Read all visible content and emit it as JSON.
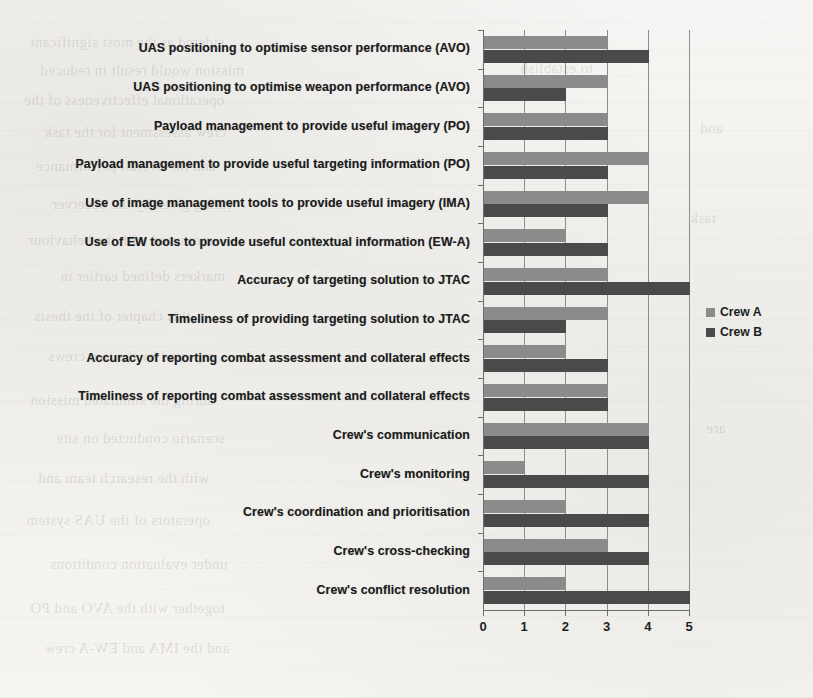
{
  "chart_data": {
    "type": "bar",
    "orientation": "horizontal",
    "title": "",
    "xlabel": "",
    "ylabel": "",
    "xlim": [
      0,
      5
    ],
    "xticks": [
      "0",
      "1",
      "2",
      "3",
      "4",
      "5"
    ],
    "grid": true,
    "legend_position": "right",
    "categories": [
      "UAS positioning to optimise sensor performance (AVO)",
      "UAS positioning to optimise weapon performance (AVO)",
      "Payload management to provide useful imagery (PO)",
      "Payload management to provide useful targeting information (PO)",
      "Use of image management tools to provide useful imagery (IMA)",
      "Use of EW tools to provide useful contextual information (EW-A)",
      "Accuracy of targeting solution to JTAC",
      "Timeliness of providing targeting solution to JTAC",
      "Accuracy of reporting combat assessment and collateral effects",
      "Timeliness of reporting combat assessment and collateral effects",
      "Crew's communication",
      "Crew's monitoring",
      "Crew's coordination and prioritisation",
      "Crew's cross-checking",
      "Crew's conflict resolution"
    ],
    "series": [
      {
        "name": "Crew A",
        "color": "#8b8b8b",
        "values": [
          3,
          3,
          3,
          4,
          4,
          2,
          3,
          3,
          2,
          3,
          4,
          1,
          2,
          3,
          2
        ]
      },
      {
        "name": "Crew B",
        "color": "#4a4a4a",
        "values": [
          4,
          2,
          3,
          3,
          3,
          3,
          5,
          2,
          3,
          3,
          4,
          4,
          4,
          4,
          5
        ]
      }
    ]
  },
  "legend": {
    "items": [
      {
        "label": "Crew A",
        "color": "#8b8b8b"
      },
      {
        "label": "Crew B",
        "color": "#4a4a4a"
      }
    ]
  }
}
